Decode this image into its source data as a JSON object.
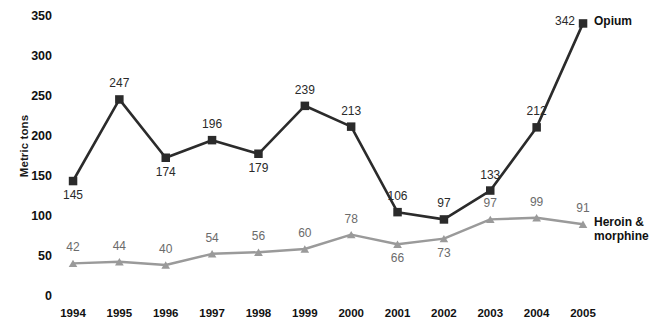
{
  "chart_data": {
    "type": "line",
    "title": "",
    "subtitle": "",
    "xlabel": "",
    "ylabel": "Metric tons",
    "categories": [
      "1994",
      "1995",
      "1996",
      "1997",
      "1998",
      "1999",
      "2000",
      "2001",
      "2002",
      "2003",
      "2004",
      "2005"
    ],
    "ylim": [
      0,
      350
    ],
    "yticks": [
      0,
      50,
      100,
      150,
      200,
      250,
      300,
      350
    ],
    "grid": false,
    "legend_position": "inline-right",
    "series": [
      {
        "name": "Opium",
        "marker": "square",
        "color": "#2b2b2b",
        "values": [
          145,
          247,
          174,
          196,
          179,
          239,
          213,
          106,
          97,
          133,
          212,
          342
        ],
        "label_positions": [
          "below",
          "above",
          "below",
          "above",
          "below",
          "above",
          "above",
          "above",
          "above",
          "above",
          "above",
          "left"
        ]
      },
      {
        "name": "Heroin & morphine",
        "marker": "triangle",
        "color": "#9a9a9a",
        "values": [
          42,
          44,
          40,
          54,
          56,
          60,
          78,
          66,
          73,
          97,
          99,
          91
        ],
        "label_positions": [
          "above",
          "above",
          "above",
          "above",
          "above",
          "above",
          "above",
          "below",
          "below",
          "above",
          "above",
          "above"
        ]
      }
    ]
  },
  "axis": {
    "y_ticks": [
      "350",
      "300",
      "250",
      "200",
      "150",
      "100",
      "50",
      "0"
    ],
    "y_title": "Metric tons",
    "x_ticks": [
      "1994",
      "1995",
      "1996",
      "1997",
      "1998",
      "1999",
      "2000",
      "2001",
      "2002",
      "2003",
      "2004",
      "2005"
    ]
  },
  "series_labels": {
    "opium": "Opium",
    "heroin_line1": "Heroin &",
    "heroin_line2": "morphine"
  },
  "data_labels": {
    "opium": [
      "145",
      "247",
      "174",
      "196",
      "179",
      "239",
      "213",
      "106",
      "97",
      "133",
      "212",
      "342"
    ],
    "heroin": [
      "42",
      "44",
      "40",
      "54",
      "56",
      "60",
      "78",
      "66",
      "73",
      "97",
      "99",
      "91"
    ]
  },
  "colors": {
    "opium_line": "#2b2b2b",
    "heroin_line": "#9a9a9a",
    "text": "#111111",
    "background": "#ffffff"
  }
}
